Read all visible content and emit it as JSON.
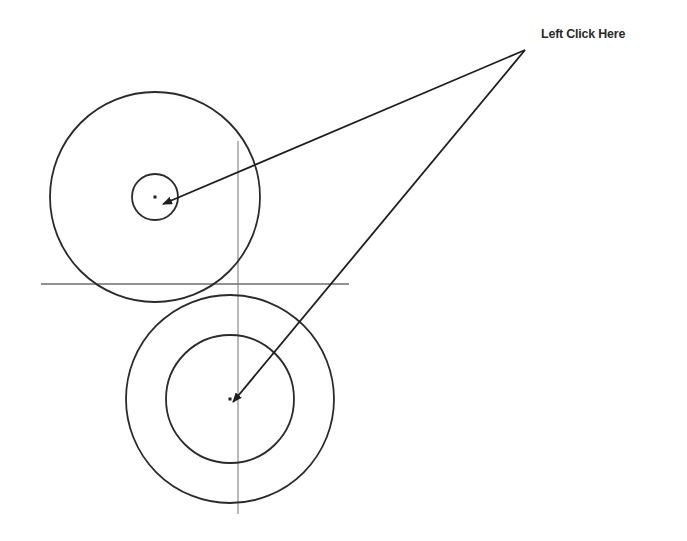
{
  "diagram": {
    "callout": {
      "label": "Left Click Here",
      "apex": {
        "x": 525,
        "y": 50
      }
    },
    "colors": {
      "stroke": "#2b2b2b",
      "construction_line": "#8a8a8a",
      "background": "#ffffff"
    },
    "construction_lines": {
      "vertical": {
        "x": 238,
        "y1": 141,
        "y2": 514
      },
      "horizontal": {
        "y": 284,
        "x1": 41,
        "x2": 349
      }
    },
    "circle_groups": [
      {
        "name": "upper-left-circles",
        "center": {
          "x": 155,
          "y": 197
        },
        "outer_radius": 105,
        "inner_radius": 23
      },
      {
        "name": "lower-circles",
        "center": {
          "x": 230,
          "y": 399
        },
        "outer_radius": 104,
        "inner_radius": 64
      }
    ],
    "arrows": [
      {
        "from": {
          "x": 525,
          "y": 50
        },
        "to": {
          "x": 163,
          "y": 204
        }
      },
      {
        "from": {
          "x": 525,
          "y": 50
        },
        "to": {
          "x": 233,
          "y": 402
        }
      }
    ]
  }
}
